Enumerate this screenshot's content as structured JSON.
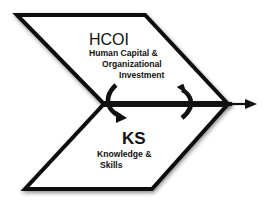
{
  "diagram": {
    "type": "chevron-flow",
    "colors": {
      "stroke": "#111111",
      "fill": "#ffffff",
      "shadow": "#9a9a9a"
    },
    "upper_block": {
      "abbr": "HCOI",
      "line1": "Human Capital &",
      "line2": "Organizational",
      "line3": "Investment"
    },
    "lower_block": {
      "abbr": "KS",
      "line1": "Knowledge &",
      "line2": "Skills"
    },
    "connectors": [
      {
        "name": "curved-arrow-down",
        "from": "HCOI",
        "to": "KS"
      },
      {
        "name": "curved-arrow-up",
        "from": "KS",
        "to": "HCOI"
      }
    ],
    "main_arrow": {
      "direction": "right"
    }
  }
}
